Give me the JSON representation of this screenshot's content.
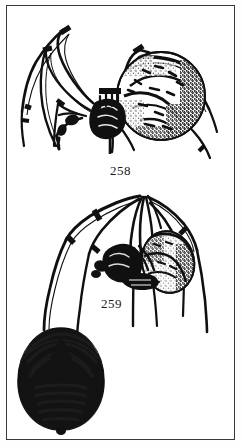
{
  "plate": {
    "background_color": "#ffffff",
    "ink_color": "#101010",
    "border_color": "#3a3a3a",
    "width": 243,
    "height": 447
  },
  "figures": [
    {
      "id": "figure-258",
      "label": "258",
      "subject": "spider-dorsal-view",
      "description": "Spider with large round abdomen, long banded legs"
    },
    {
      "id": "figure-259",
      "label": "259",
      "subject": "spider-lateral-view",
      "description": "Spider hanging with legs gathered upward, oval abdomen"
    },
    {
      "id": "figure-abdomen",
      "label": "",
      "subject": "abdomen-detail",
      "description": "Oval abdomen with dark folium markings"
    }
  ],
  "labels": {
    "fig_258": "258",
    "fig_259": "259"
  }
}
